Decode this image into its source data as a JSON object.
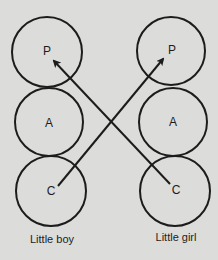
{
  "diagram": {
    "background": "#dcdcda",
    "stroke_color": "#1c1c1c",
    "figures": [
      {
        "caption": "Little boy",
        "states": [
          {
            "label": "P",
            "cx": 47,
            "cy": 52,
            "r": 35
          },
          {
            "label": "A",
            "cx": 49,
            "cy": 122,
            "r": 34
          },
          {
            "label": "C",
            "cx": 51,
            "cy": 191,
            "r": 35
          }
        ]
      },
      {
        "caption": "Little girl",
        "states": [
          {
            "label": "P",
            "cx": 171,
            "cy": 51,
            "r": 34
          },
          {
            "label": "A",
            "cx": 173,
            "cy": 122,
            "r": 34
          },
          {
            "label": "C",
            "cx": 175,
            "cy": 191,
            "r": 35
          }
        ]
      }
    ],
    "transactions": [
      {
        "from": "Little boy C",
        "to": "Little girl P",
        "x1": 58,
        "y1": 186,
        "x2": 163,
        "y2": 59
      },
      {
        "from": "Little girl C",
        "to": "Little boy P",
        "x1": 170,
        "y1": 184,
        "x2": 54,
        "y2": 61
      }
    ]
  }
}
